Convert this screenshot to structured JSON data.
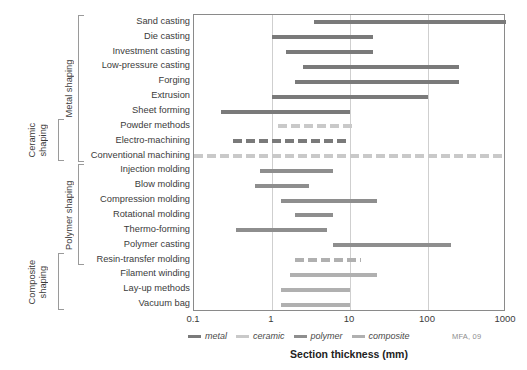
{
  "chart_data": {
    "type": "bar",
    "title": "",
    "xlabel": "Section thickness (mm)",
    "ylabel": "",
    "xscale": "log",
    "xlim": [
      0.1,
      1000
    ],
    "xticks": [
      "0.1",
      "1",
      "10",
      "100",
      "1000"
    ],
    "grid": "vertical",
    "legend_position": "bottom-left",
    "credit": "MFA, 09",
    "legend": [
      {
        "name": "metal",
        "color": "#7a7a7a"
      },
      {
        "name": "ceramic",
        "color": "#c9c9c9"
      },
      {
        "name": "polymer",
        "color": "#8e8e8e"
      },
      {
        "name": "composite",
        "color": "#b0b0b0"
      }
    ],
    "families": [
      {
        "label": "Metal shaping",
        "first": 0,
        "last": 9
      },
      {
        "label": "Ceramic shaping",
        "first": 7,
        "last": 9
      },
      {
        "label": "Polymer shaping",
        "first": 10,
        "last": 16
      },
      {
        "label": "Composite shaping",
        "first": 16,
        "last": 19
      }
    ],
    "categories": [
      "Sand casting",
      "Die casting",
      "Investment casting",
      "Low-pressure casting",
      "Forging",
      "Extrusion",
      "Sheet forming",
      "Powder methods",
      "Electro-machining",
      "Conventional machining",
      "Injection molding",
      "Blow molding",
      "Compression molding",
      "Rotational molding",
      "Thermo-forming",
      "Polymer casting",
      "Resin-transfer molding",
      "Filament winding",
      "Lay-up methods",
      "Vacuum bag"
    ],
    "bars": [
      {
        "process": "Sand casting",
        "min": 3.5,
        "max": 1000,
        "material": "metal",
        "style": "solid"
      },
      {
        "process": "Die casting",
        "min": 1.0,
        "max": 20,
        "material": "metal",
        "style": "solid"
      },
      {
        "process": "Investment casting",
        "min": 1.5,
        "max": 20,
        "material": "metal",
        "style": "solid"
      },
      {
        "process": "Low-pressure casting",
        "min": 2.5,
        "max": 250,
        "material": "metal",
        "style": "solid"
      },
      {
        "process": "Forging",
        "min": 2.0,
        "max": 250,
        "material": "metal",
        "style": "solid"
      },
      {
        "process": "Extrusion",
        "min": 1.0,
        "max": 100,
        "material": "metal",
        "style": "solid"
      },
      {
        "process": "Sheet forming",
        "min": 0.22,
        "max": 10,
        "material": "metal",
        "style": "solid"
      },
      {
        "process": "Powder methods",
        "min": 1.2,
        "max": 12,
        "material": "ceramic",
        "style": "dashed"
      },
      {
        "process": "Electro-machining",
        "min": 0.32,
        "max": 10,
        "material": "metal",
        "style": "dashed"
      },
      {
        "process": "Conventional machining",
        "min": 0.1,
        "max": 900,
        "material": "ceramic",
        "style": "dashed"
      },
      {
        "process": "Injection molding",
        "min": 0.7,
        "max": 6.0,
        "material": "polymer",
        "style": "solid"
      },
      {
        "process": "Blow molding",
        "min": 0.6,
        "max": 3.0,
        "material": "polymer",
        "style": "solid"
      },
      {
        "process": "Compression molding",
        "min": 1.3,
        "max": 22,
        "material": "polymer",
        "style": "solid"
      },
      {
        "process": "Rotational molding",
        "min": 2.0,
        "max": 6.0,
        "material": "polymer",
        "style": "solid"
      },
      {
        "process": "Thermo-forming",
        "min": 0.35,
        "max": 5.0,
        "material": "polymer",
        "style": "solid"
      },
      {
        "process": "Polymer casting",
        "min": 6.0,
        "max": 200,
        "material": "polymer",
        "style": "solid"
      },
      {
        "process": "Resin-transfer molding",
        "min": 2.0,
        "max": 14,
        "material": "composite",
        "style": "dashed"
      },
      {
        "process": "Filament winding",
        "min": 1.7,
        "max": 22,
        "material": "composite",
        "style": "solid"
      },
      {
        "process": "Lay-up methods",
        "min": 1.3,
        "max": 10,
        "material": "composite",
        "style": "solid"
      },
      {
        "process": "Vacuum bag",
        "min": 1.3,
        "max": 10,
        "material": "composite",
        "style": "solid"
      }
    ]
  }
}
